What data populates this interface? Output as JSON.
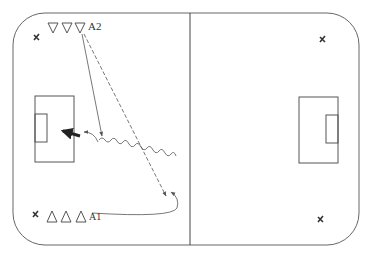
{
  "diagram": {
    "type": "soccer-drill",
    "labels": {
      "group_top": "A2",
      "group_bottom": "A1"
    },
    "colors": {
      "line": "#555555",
      "background": "#ffffff"
    },
    "elements": {
      "cones_top": 3,
      "cones_bottom": 3,
      "corner_markers": 4,
      "penalty_areas": 2
    }
  }
}
